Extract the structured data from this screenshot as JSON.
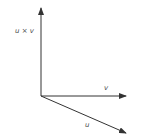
{
  "diagram": {
    "title": "",
    "type": "vector-cross-product",
    "colors": {
      "stroke": "#333333",
      "text": "#4a4a4a",
      "background": "#ffffff"
    },
    "origin": {
      "x": 41,
      "y": 96
    },
    "vectors": [
      {
        "id": "uxv",
        "label": "u × v",
        "end": {
          "x": 41,
          "y": 8
        }
      },
      {
        "id": "v",
        "label": "v",
        "end": {
          "x": 126,
          "y": 96
        }
      },
      {
        "id": "u",
        "label": "u",
        "end": {
          "x": 126,
          "y": 133
        }
      }
    ]
  }
}
